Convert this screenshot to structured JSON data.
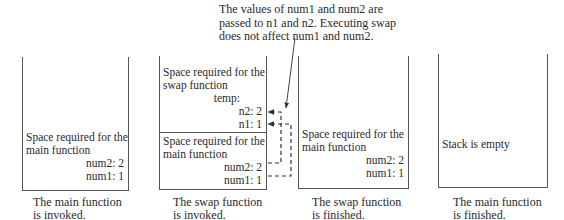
{
  "annotation": {
    "line1": "The values of num1 and num2 are",
    "line2": "passed to n1 and n2. Executing swap",
    "line3": "does not affect num1 and num2."
  },
  "stacks": [
    {
      "frames": [
        {
          "title1": "Space required for the",
          "title2": "main function",
          "vars": [
            "num2: 2",
            "num1: 1"
          ]
        }
      ],
      "caption1": "The main function",
      "caption2": "is invoked."
    },
    {
      "frames": [
        {
          "title1": "Space required for the",
          "title2": "swap function",
          "vars": [
            "temp:",
            "n2: 2",
            "n1: 1"
          ]
        },
        {
          "title1": "Space required for the",
          "title2": "main function",
          "vars": [
            "num2: 2",
            "num1: 1"
          ]
        }
      ],
      "caption1": "The swap function",
      "caption2": "is invoked."
    },
    {
      "frames": [
        {
          "title1": "Space required for the",
          "title2": "main function",
          "vars": [
            "num2: 2",
            "num1: 1"
          ]
        }
      ],
      "caption1": "The swap function",
      "caption2": "is finished."
    },
    {
      "frames": [
        {
          "title1": "Stack is empty"
        }
      ],
      "caption1": "The main function",
      "caption2": "is finished."
    }
  ],
  "colors": {
    "line": "#555555",
    "text": "#2a2a2a",
    "background": "#ffffff"
  }
}
